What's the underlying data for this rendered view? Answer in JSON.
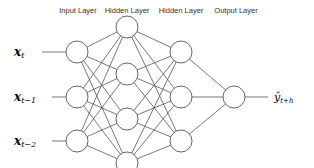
{
  "layers": [
    {
      "label": "Input Layer",
      "x": 78
    },
    {
      "label": "Hidden Layer",
      "x": 127
    },
    {
      "label": "Hidden Layer",
      "x": 181
    },
    {
      "label": "Output Layer",
      "x": 234
    }
  ],
  "inputs": [
    {
      "symbol": "x",
      "subscript": "t"
    },
    {
      "symbol": "x",
      "subscript": "t−1"
    },
    {
      "symbol": "x",
      "subscript": "t−2"
    }
  ],
  "output": {
    "symbol": "ŷ",
    "subscript": "t+h"
  },
  "nodes": {
    "input": [
      [
        77,
        52
      ],
      [
        77,
        97
      ],
      [
        77,
        141
      ]
    ],
    "hidden1": [
      [
        127,
        27
      ],
      [
        127,
        74
      ],
      [
        127,
        119
      ],
      [
        127,
        163
      ]
    ],
    "hidden2": [
      [
        181,
        52
      ],
      [
        181,
        97
      ],
      [
        181,
        141
      ]
    ],
    "output": [
      [
        234,
        97
      ]
    ]
  },
  "style": {
    "node_radius": 11,
    "stroke": "#555555"
  }
}
